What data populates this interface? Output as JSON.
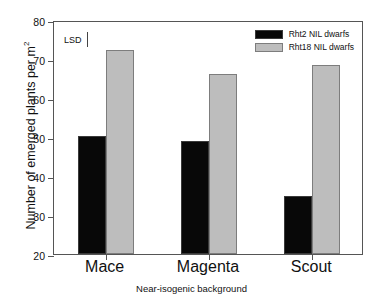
{
  "chart_data": {
    "type": "bar",
    "title": "",
    "xlabel": "Near-isogenic background",
    "ylabel": "Number of emerged plants per m",
    "ylabel_superscript": "2",
    "categories": [
      "Mace",
      "Magenta",
      "Scout"
    ],
    "series": [
      {
        "name": "Rht2 NIL dwarfs",
        "color": "#080808",
        "values": [
          50.3,
          49.0,
          35.0
        ]
      },
      {
        "name": "Rht18 NIL dwarfs",
        "color": "#bdbdbd",
        "values": [
          72.3,
          66.2,
          68.5
        ]
      }
    ],
    "ylim": [
      20,
      80
    ],
    "yticks": [
      20,
      30,
      40,
      50,
      60,
      70,
      80
    ],
    "ytick_labels": [
      "20",
      "30",
      "40",
      "50",
      "60",
      "70",
      "80"
    ],
    "grid": false,
    "legend_position": "top-right",
    "annotations": [
      {
        "name": "lsd",
        "label": "LSD",
        "marker": "error-bar"
      }
    ]
  },
  "legend": {
    "entries": [
      {
        "label": "Rht2 NIL dwarfs"
      },
      {
        "label": "Rht18 NIL dwarfs"
      }
    ]
  },
  "axes": {
    "y_title_main": "Number of emerged plants per m",
    "y_title_sup": "2",
    "x_title": "Near-isogenic background"
  }
}
